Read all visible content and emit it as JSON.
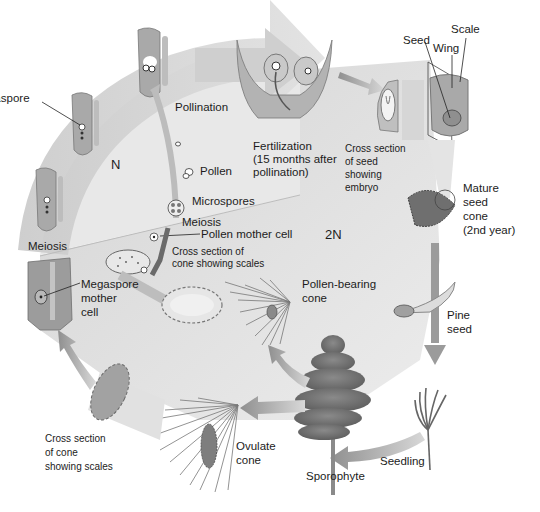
{
  "diagram": {
    "colors": {
      "background": "#ffffff",
      "cycle_band": "#d2d2d2",
      "haploid_zone": "#e6e6e6",
      "diploid_zone": "#dcdcdc",
      "arrow": "#9a9a9a",
      "structure_fill": "#a8a8a8",
      "structure_dark": "#7a7a7a",
      "label_text": "#1c1c1c"
    },
    "zones": {
      "haploid": "N",
      "diploid": "2N"
    },
    "labels": {
      "megaspore": "Megaspore",
      "pollination": "Pollination",
      "pollen": "Pollen",
      "microspores": "Microspores",
      "meiosis_top": "Meiosis",
      "pollen_mother_cell": "Pollen mother cell",
      "meiosis_left": "Meiosis",
      "cross_section_cone_top_1": "Cross section of",
      "cross_section_cone_top_2": "cone showing scales",
      "megaspore_mother_cell_1": "Megaspore",
      "megaspore_mother_cell_2": "mother",
      "megaspore_mother_cell_3": "cell",
      "pollen_bearing_cone_1": "Pollen-bearing",
      "pollen_bearing_cone_2": "cone",
      "fertilization_1": "Fertilization",
      "fertilization_2": "(15 months after",
      "fertilization_3": "pollination)",
      "cross_section_seed_1": "Cross section",
      "cross_section_seed_2": "of seed",
      "cross_section_seed_3": "showing",
      "cross_section_seed_4": "embryo",
      "seed": "Seed",
      "wing": "Wing",
      "scale": "Scale",
      "mature_cone_1": "Mature",
      "mature_cone_2": "seed",
      "mature_cone_3": "cone",
      "mature_cone_4": "(2nd year)",
      "pine_seed_1": "Pine",
      "pine_seed_2": "seed",
      "seedling": "Seedling",
      "sporophyte": "Sporophyte",
      "ovulate_cone_1": "Ovulate",
      "ovulate_cone_2": "cone",
      "cross_section_cone_bottom_1": "Cross section",
      "cross_section_cone_bottom_2": "of cone",
      "cross_section_cone_bottom_3": "showing scales"
    },
    "stages": [
      "Megaspore mother cell",
      "Meiosis",
      "Megaspore",
      "Pollination",
      "Fertilization",
      "Cross section of seed showing embryo",
      "Mature seed cone",
      "Pine seed",
      "Seedling",
      "Sporophyte",
      "Ovulate cone",
      "Cross section of cone showing scales"
    ]
  }
}
